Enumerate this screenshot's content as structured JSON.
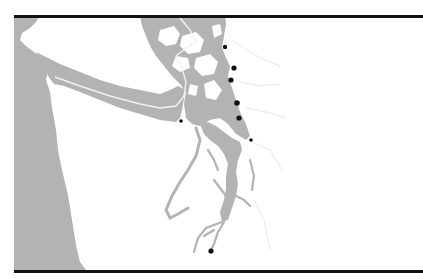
{
  "map": {
    "title": "",
    "colors": {
      "water": "#b3b3b3",
      "land": "#ffffff",
      "frame": "#111111",
      "boundary": "#f2f2f2",
      "marker": "#111111",
      "river": "#e6e6e6"
    },
    "frame": {
      "left": 14,
      "top": 15,
      "right": 423,
      "bottom": 273
    },
    "markers": [
      {
        "id": "m1",
        "x": 225,
        "y": 47,
        "r": 2.2
      },
      {
        "id": "m2",
        "x": 234,
        "y": 68,
        "r": 2.6
      },
      {
        "id": "m3",
        "x": 231,
        "y": 80,
        "r": 2.6
      },
      {
        "id": "m4",
        "x": 237,
        "y": 103,
        "r": 2.8
      },
      {
        "id": "m5",
        "x": 239,
        "y": 118,
        "r": 2.6
      },
      {
        "id": "m6",
        "x": 251,
        "y": 140,
        "r": 1.8
      },
      {
        "id": "m7",
        "x": 181,
        "y": 121,
        "r": 1.8
      },
      {
        "id": "m8",
        "x": 211,
        "y": 251,
        "r": 2.6
      }
    ]
  }
}
